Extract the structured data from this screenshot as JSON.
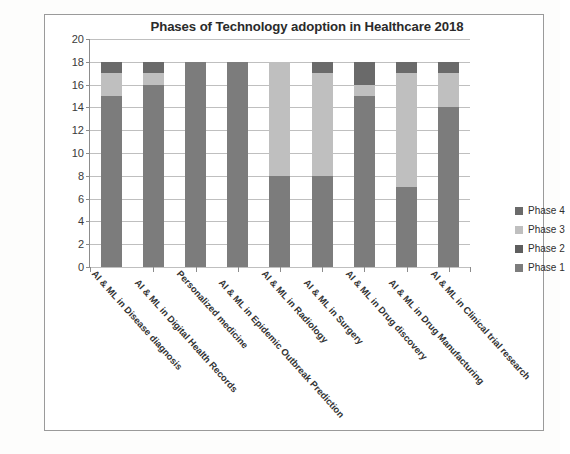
{
  "chart_data": {
    "type": "bar",
    "stacked": true,
    "title": "Phases of Technology adoption in Healthcare 2018",
    "xlabel": "",
    "ylabel": "",
    "ylim": [
      0,
      20
    ],
    "yticks": [
      20,
      18,
      16,
      14,
      12,
      10,
      8,
      6,
      4,
      2,
      0
    ],
    "grid": true,
    "legend_position": "right",
    "categories": [
      "AI & ML in Disease diagnosis",
      "AI & ML in Digital Health Records",
      "Personalized medicine",
      "AI & ML in Epidemic Outbreak Prediction",
      "AI & ML in Radiology",
      "AI & ML in Surgery",
      "AI & ML in Drug discovery",
      "AI & ML in Drug Manufacturing",
      "AI  & ML in Clinical trial research"
    ],
    "series": [
      {
        "name": "Phase 1",
        "color": "#7c7c7c",
        "values": [
          15,
          16,
          18,
          18,
          8,
          8,
          15,
          7,
          14
        ]
      },
      {
        "name": "Phase 2",
        "color": "#5e5e5e",
        "values": [
          0,
          0,
          0,
          0,
          0,
          0,
          0,
          0,
          0
        ]
      },
      {
        "name": "Phase 3",
        "color": "#bfbfbf",
        "values": [
          2,
          1,
          0,
          0,
          10,
          9,
          1,
          10,
          3
        ]
      },
      {
        "name": "Phase 4",
        "color": "#6a6a6a",
        "values": [
          1,
          1,
          0,
          0,
          0,
          1,
          2,
          1,
          1
        ]
      }
    ],
    "totals": [
      18,
      18,
      18,
      18,
      18,
      18,
      18,
      18,
      18
    ],
    "legend": [
      {
        "label": "Phase 4",
        "color": "#6a6a6a"
      },
      {
        "label": "Phase 3",
        "color": "#bfbfbf"
      },
      {
        "label": "Phase 2",
        "color": "#5e5e5e"
      },
      {
        "label": "Phase 1",
        "color": "#7c7c7c"
      }
    ]
  }
}
